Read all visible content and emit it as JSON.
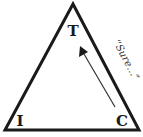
{
  "diagram": {
    "shape": "triangle",
    "vertices": {
      "top": {
        "label": "T"
      },
      "bottom_left": {
        "label": "I"
      },
      "bottom_right": {
        "label": "C"
      }
    },
    "arrow": {
      "from": "C",
      "to": "T"
    },
    "annotation": "“Sure…”",
    "colors": {
      "stroke": "#1a1a1a",
      "background": "#ffffff"
    }
  }
}
